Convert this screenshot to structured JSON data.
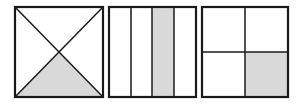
{
  "diagram": {
    "colors": {
      "stroke": "#1a1a1a",
      "fill_shaded": "#d9d9d9",
      "fill_blank": "#ffffff"
    },
    "figures": [
      {
        "name": "square-diagonals",
        "division": "diagonals into 4 triangles",
        "parts": 4,
        "shaded_parts": 1,
        "shaded_region": "bottom triangle",
        "box": {
          "x": 15,
          "y": 7,
          "w": 88,
          "h": 90
        }
      },
      {
        "name": "square-vertical-strips",
        "division": "4 vertical strips",
        "parts": 4,
        "shaded_parts": 1,
        "shaded_region": "third strip from left",
        "box": {
          "x": 109,
          "y": 7,
          "w": 87,
          "h": 90
        }
      },
      {
        "name": "square-quadrants",
        "division": "2x2 grid",
        "parts": 4,
        "shaded_parts": 1,
        "shaded_region": "bottom-right quadrant",
        "box": {
          "x": 202,
          "y": 7,
          "w": 86,
          "h": 90
        }
      }
    ]
  }
}
